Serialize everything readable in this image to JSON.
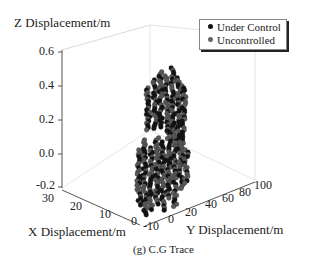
{
  "chart_data": {
    "type": "scatter3d",
    "title": "",
    "caption": "(g) C.G Trace",
    "xlabel": "X Displacement/m",
    "ylabel": "Y Displacement/m",
    "zlabel": "Z Displacement/m",
    "x_ticks": [
      "30",
      "20",
      "10",
      "0",
      "-10"
    ],
    "y_ticks": [
      "0",
      "20",
      "40",
      "60",
      "80",
      "100"
    ],
    "z_ticks": [
      "0.6",
      "0.4",
      "0.2",
      "0.0",
      "-0.2"
    ],
    "xlim": [
      -10,
      30
    ],
    "ylim": [
      0,
      100
    ],
    "zlim": [
      -0.2,
      0.6
    ],
    "grid": false,
    "legend_position": "upper right",
    "series": [
      {
        "name": "Under Control",
        "color": "#111111",
        "description": "dense point traces forming vertical columns near x≈0, y≈0–30; two clusters at z≈0.1–0.4 and z≈-0.2–0.1"
      },
      {
        "name": "Uncontrolled",
        "color": "#555555",
        "description": "overlapping grey point traces in same region, z range ≈-0.2–0.4"
      }
    ],
    "colors": {
      "under_control": "#111111",
      "uncontrolled": "#5a5a5a",
      "axis": "#555555",
      "box": "#d8d8d8"
    }
  },
  "legend": {
    "items": [
      {
        "label": "Under Control",
        "color": "#111111"
      },
      {
        "label": "Uncontrolled",
        "color": "#666666"
      }
    ]
  }
}
